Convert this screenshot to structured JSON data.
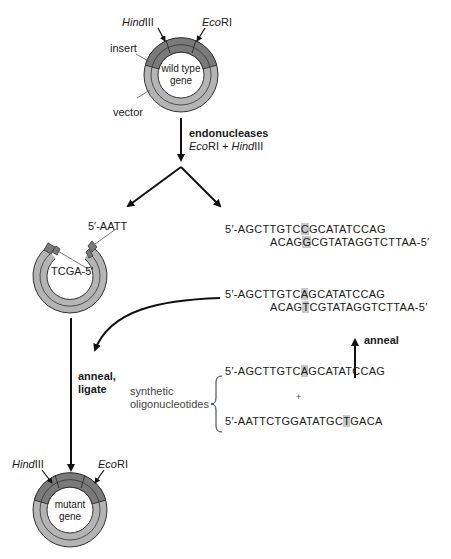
{
  "colors": {
    "insert_dark": "#7a7a7a",
    "vector_light": "#b4b4b4",
    "outline": "#333333",
    "highlight": "#c8c8c8",
    "text": "#1a1a1a"
  },
  "wild_type_plasmid": {
    "center_label_line1": "wild type",
    "center_label_line2": "gene",
    "site_left_italic": "Hind",
    "site_left_roman": "III",
    "site_right_italic": "Eco",
    "site_right_roman": "RI",
    "insert_label": "insert",
    "vector_label": "vector"
  },
  "digest_step": {
    "label_line1": "endonucleases",
    "enzyme1_italic": "Eco",
    "enzyme1_roman": "RI + ",
    "enzyme2_italic": "Hind",
    "enzyme2_roman": "III"
  },
  "cut_vector": {
    "end_top": "5′-AATT",
    "end_bottom": "TCGA-5′"
  },
  "wild_fragment": {
    "top_pre": "5′-AGCTTGTC",
    "top_hl": "C",
    "top_post": "GCATATCCAG",
    "bottom_pre": "ACAG",
    "bottom_hl": "G",
    "bottom_post": "CGTATAGGTCTTAA-5′"
  },
  "mutant_duplex": {
    "top_pre": "5′-AGCTTGTC",
    "top_hl": "A",
    "top_post": "GCATATCCAG",
    "bottom_pre": "ACAG",
    "bottom_hl": "T",
    "bottom_post": "CGTATAGGTCTTAA-5′"
  },
  "anneal_label": "anneal",
  "anneal_ligate": {
    "line1": "anneal,",
    "line2": "ligate"
  },
  "oligos": {
    "label_line1": "synthetic",
    "label_line2": "oligonucleotides",
    "oligo1_pre": "5′-AGCTTGTC",
    "oligo1_hl": "A",
    "oligo1_post": "GCATATCCAG",
    "plus": "+",
    "oligo2_pre": "5′-AATTCTGGATATGC",
    "oligo2_hl": "T",
    "oligo2_post": "GACA"
  },
  "mutant_plasmid": {
    "center_label_line1": "mutant",
    "center_label_line2": "gene",
    "site_left_italic": "Hind",
    "site_left_roman": "III",
    "site_right_italic": "Eco",
    "site_right_roman": "RI"
  }
}
